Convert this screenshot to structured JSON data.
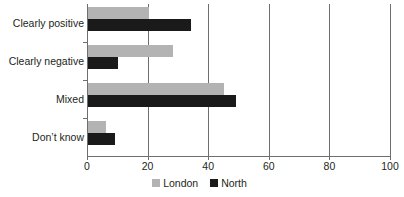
{
  "chart_data": {
    "type": "bar",
    "orientation": "horizontal",
    "title": "",
    "xlabel": "",
    "ylabel": "",
    "categories": [
      "Clearly positive",
      "Clearly negative",
      "Mixed",
      "Don’t know"
    ],
    "series": [
      {
        "name": "London",
        "color": "#b3b3b3",
        "values": [
          20,
          28,
          45,
          6
        ]
      },
      {
        "name": "North",
        "color": "#1a1a1a",
        "values": [
          34,
          10,
          49,
          9
        ]
      }
    ],
    "xlim": [
      0,
      100
    ],
    "xticks": [
      0,
      20,
      40,
      60,
      80,
      100
    ],
    "xtick_labels": [
      "0",
      "20",
      "40",
      "60",
      "80",
      "100"
    ],
    "grid": "vertical",
    "legend_position": "bottom-center"
  },
  "legend": {
    "items": [
      {
        "label": "London",
        "color": "#b3b3b3"
      },
      {
        "label": "North",
        "color": "#1a1a1a"
      }
    ]
  },
  "colors": {
    "axis": "#6d6e71",
    "text": "#231f20",
    "background": "#ffffff"
  }
}
